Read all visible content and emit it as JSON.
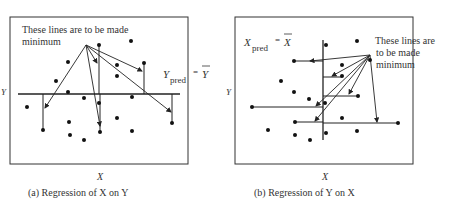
{
  "panel_a": {
    "annotation_line1": "These lines are to be made",
    "annotation_line2": "minimum",
    "pred_label_var": "Y",
    "pred_label_sub": "pred",
    "pred_label_eq": "=",
    "pred_label_mean": "Y",
    "x_axis_label": "X",
    "y_axis_label": "Y",
    "caption": "(a)  Regression of X on Y"
  },
  "panel_b": {
    "annotation_line1": "These lines are",
    "annotation_line2": "to be made",
    "annotation_line3": "minimum",
    "pred_label_var": "X",
    "pred_label_sub": "pred",
    "pred_label_eq": "=",
    "pred_label_mean": "X",
    "x_axis_label": "X",
    "y_axis_label": "Y",
    "caption": "(b)  Regression of Y on X"
  }
}
